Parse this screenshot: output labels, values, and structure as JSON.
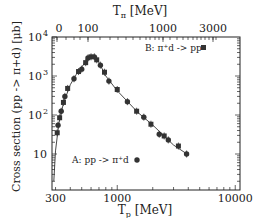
{
  "chart_data": {
    "type": "scatter",
    "title": "",
    "xlabel": "T_p [MeV]",
    "xlabel_main": "T",
    "xlabel_sub": "p",
    "xlabel_unit": "[MeV]",
    "x2label": "T_π [MeV]",
    "x2label_main": "T",
    "x2label_sub": "π",
    "x2label_unit": "[MeV]",
    "ylabel": "Cross section (pp -> π+d) [μb]",
    "xscale": "log",
    "yscale": "log",
    "xlim": [
      280,
      10000
    ],
    "ylim": [
      1.3,
      10000
    ],
    "x_ticks": [
      "300",
      "1000",
      "10000"
    ],
    "x2_ticks": [
      "0",
      "100",
      "1000",
      "3000"
    ],
    "y_ticks": [
      "10",
      "10²",
      "10³",
      "10⁴"
    ],
    "legend": [
      {
        "label": "A:  pp -> π⁺d",
        "marker": "circle"
      },
      {
        "label": "B:  π⁺d -> pp",
        "marker": "square"
      }
    ],
    "series": [
      {
        "name": "data (A & B combined)",
        "x": [
          310,
          315,
          325,
          335,
          350,
          360,
          380,
          430,
          470,
          500,
          540,
          565,
          600,
          640,
          670,
          720,
          780,
          850,
          1000,
          1220,
          1460,
          1680,
          1930,
          2270,
          2500,
          2710,
          3300,
          3870
        ],
        "y": [
          35,
          55,
          85,
          125,
          210,
          300,
          480,
          850,
          1300,
          1500,
          2200,
          2900,
          3100,
          3100,
          2600,
          1900,
          1250,
          740,
          450,
          220,
          125,
          88,
          58,
          32,
          29,
          23,
          16,
          10
        ]
      },
      {
        "name": "fit curve",
        "x": [
          290,
          300,
          320,
          350,
          400,
          450,
          500,
          560,
          600,
          650,
          700,
          800,
          1000,
          1500,
          2000,
          3000,
          4000
        ],
        "y": [
          2,
          12,
          60,
          200,
          600,
          1100,
          1700,
          2700,
          3050,
          2900,
          2200,
          1000,
          420,
          115,
          55,
          17,
          9.5
        ]
      }
    ]
  }
}
